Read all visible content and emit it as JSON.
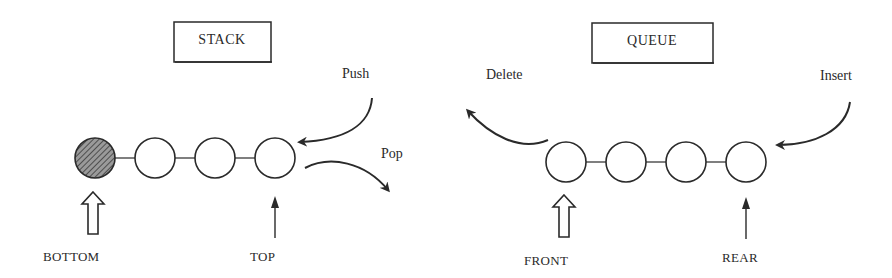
{
  "stack": {
    "title": "STACK",
    "push_label": "Push",
    "pop_label": "Pop",
    "bottom_label": "BOTTOM",
    "top_label": "TOP",
    "node_count": 4,
    "filled_node_index": 0
  },
  "queue": {
    "title": "QUEUE",
    "delete_label": "Delete",
    "insert_label": "Insert",
    "front_label": "FRONT",
    "rear_label": "REAR",
    "node_count": 4
  },
  "colors": {
    "stroke": "#2a2a2a",
    "background": "#ffffff",
    "hatch": "#555555"
  }
}
